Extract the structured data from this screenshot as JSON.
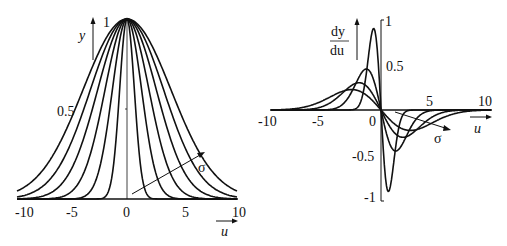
{
  "chart_data": [
    {
      "type": "line",
      "title": "",
      "xlabel": "u",
      "ylabel": "y",
      "xlim": [
        -10,
        10
      ],
      "ylim": [
        0,
        1
      ],
      "xticks": [
        "-10",
        "-5",
        "0",
        "5",
        "10"
      ],
      "yticks": [
        "0.5",
        "1"
      ],
      "annotation": "σ",
      "function": "y = exp(-u^2 / (2 σ^2))",
      "series": [
        {
          "name": "σ=0.67",
          "sigma": 0.67
        },
        {
          "name": "σ=1.33",
          "sigma": 1.33
        },
        {
          "name": "σ=2",
          "sigma": 2
        },
        {
          "name": "σ=2.67",
          "sigma": 2.67
        },
        {
          "name": "σ=3.33",
          "sigma": 3.33
        },
        {
          "name": "σ=4",
          "sigma": 4
        }
      ],
      "grid": false,
      "legend": "none"
    },
    {
      "type": "line",
      "title": "",
      "xlabel": "u",
      "ylabel": "dy/du",
      "xlim": [
        -10,
        10
      ],
      "ylim": [
        -1,
        1
      ],
      "xticks": [
        "-10",
        "-5",
        "0",
        "5",
        "10"
      ],
      "yticks": [
        "-1",
        "-0.5",
        "0.5",
        "1"
      ],
      "annotation": "σ",
      "function": "dy/du = -(u/σ^2) exp(-u^2 / (2 σ^2))",
      "series": [
        {
          "name": "σ=0.67",
          "sigma": 0.67,
          "peak": 0.9
        },
        {
          "name": "σ=1.33",
          "sigma": 1.33,
          "peak": 0.45
        },
        {
          "name": "σ=2",
          "sigma": 2,
          "peak": 0.3
        },
        {
          "name": "σ=2.67",
          "sigma": 2.67,
          "peak": 0.23
        }
      ],
      "grid": false,
      "legend": "none"
    }
  ],
  "left": {
    "y_label": "y",
    "x_label": "u",
    "sigma_label": "σ",
    "ticks_x": [
      "-10",
      "-5",
      "0",
      "5",
      "10"
    ],
    "tick_y_half": "0.5",
    "tick_y_one": "1"
  },
  "right": {
    "y_label_num": "dy",
    "y_label_den": "du",
    "x_label": "u",
    "sigma_label": "σ",
    "ticks_x": [
      "-10",
      "-5",
      "0",
      "5",
      "10"
    ],
    "ticks_y": [
      "1",
      "0.5",
      "-0.5",
      "-1"
    ]
  }
}
